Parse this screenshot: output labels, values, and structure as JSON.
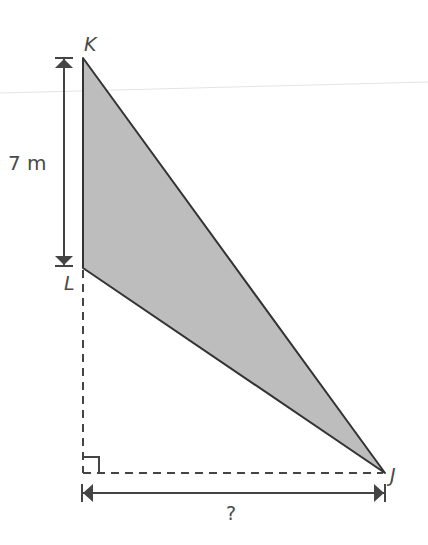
{
  "diagram": {
    "type": "right-triangle-geometry",
    "vertices": {
      "K": {
        "label": "K"
      },
      "L": {
        "label": "L"
      },
      "J": {
        "label": "J"
      }
    },
    "measurements": {
      "KL": {
        "label": "7 m",
        "value": 7,
        "unit": "m"
      },
      "horizontal": {
        "label": "?"
      }
    },
    "shaded_region": "triangle KLJ",
    "fill_color": "#bdbdbd",
    "stroke_color": "#333333",
    "right_angle_marker": true
  }
}
